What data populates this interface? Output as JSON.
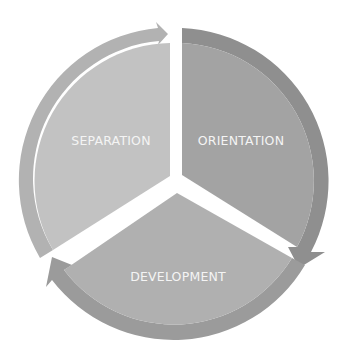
{
  "diagram": {
    "type": "cycle",
    "center": [
      177,
      181
    ],
    "segments": [
      {
        "label": "ORIENTATION",
        "fill": "#a3a3a3",
        "arrow_fill": "#8f8f8f"
      },
      {
        "label": "DEVELOPMENT",
        "fill": "#b0b0b0",
        "arrow_fill": "#9b9b9b"
      },
      {
        "label": "SEPARATION",
        "fill": "#c2c2c2",
        "arrow_fill": "#b2b2b2"
      }
    ],
    "background": "#ffffff",
    "gap_color": "#ffffff"
  }
}
